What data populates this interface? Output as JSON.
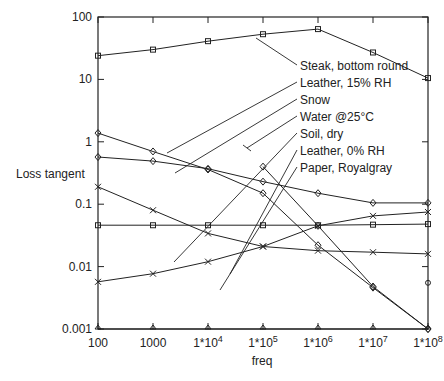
{
  "chart_data": {
    "type": "line",
    "title": "",
    "xlabel": "freq",
    "ylabel": "Loss tangent",
    "xscale": "log",
    "yscale": "log",
    "xlim": [
      100,
      100000000
    ],
    "ylim": [
      0.001,
      100
    ],
    "grid": false,
    "legend_position": "inline labels with leader lines, upper right",
    "x": [
      100,
      1000,
      10000,
      100000,
      1000000,
      10000000,
      100000000
    ],
    "x_tick_labels": [
      "100",
      "1000",
      "1*10^4",
      "1*10^5",
      "1*10^6",
      "1*10^7",
      "1*10^8"
    ],
    "y_tick_labels": [
      "0.001",
      "0.01",
      "0.1",
      "1",
      "10",
      "100"
    ],
    "series": [
      {
        "name": "Steak, bottom round",
        "marker": "square",
        "values": [
          24,
          30,
          41,
          53,
          64,
          27,
          10.5
        ]
      },
      {
        "name": "Leather, 15% RH",
        "marker": "diamond",
        "values": [
          1.38,
          0.7,
          0.36,
          0.15,
          0.022,
          0.0046,
          0.001
        ]
      },
      {
        "name": "Snow",
        "marker": "diamond",
        "values": [
          0.57,
          0.49,
          0.37,
          0.23,
          0.15,
          0.105,
          0.105
        ]
      },
      {
        "name": "Water @25°C",
        "marker": "cross",
        "values": [
          0.19,
          0.08,
          0.034,
          0.021,
          0.018,
          0.017,
          0.016
        ]
      },
      {
        "name": "Soil, dry",
        "marker": "cross",
        "values": [
          0.0057,
          0.0077,
          0.012,
          0.021,
          0.045,
          0.065,
          0.075
        ]
      },
      {
        "name": "Leather, 0% RH",
        "marker": "square",
        "values": [
          0.046,
          0.046,
          0.046,
          0.046,
          0.046,
          0.047,
          0.048
        ]
      },
      {
        "name": "Paper, Royalgray",
        "marker": "diamond",
        "values": [
          null,
          null,
          null,
          0.4,
          0.045,
          0.0048,
          0.001
        ]
      },
      {
        "name": "baseline",
        "marker": "triangle",
        "values": [
          0.001,
          0.001,
          0.001,
          0.001,
          0.001,
          0.001,
          0.001
        ]
      }
    ],
    "extra_points": [
      {
        "x": 100000000,
        "y": 0.0055,
        "marker": "circle"
      }
    ]
  },
  "labels": [
    {
      "text": "Steak, bottom round",
      "anchor": [
        256,
        38
      ]
    },
    {
      "text": "Leather, 15% RH",
      "anchor": [
        167,
        153
      ]
    },
    {
      "text": "Snow",
      "anchor": [
        175,
        173
      ]
    },
    {
      "text": "Water @25°C",
      "anchor": [
        247,
        148
      ]
    },
    {
      "text": "Soil, dry",
      "anchor": [
        174,
        262
      ]
    },
    {
      "text": "Leather, 0% RH",
      "anchor": [
        230,
        274
      ]
    },
    {
      "text": "Paper, Royalgray",
      "anchor": [
        220,
        290
      ]
    }
  ]
}
